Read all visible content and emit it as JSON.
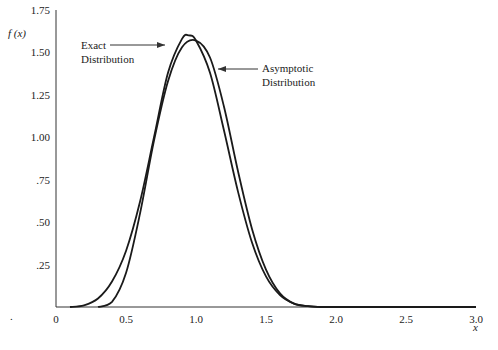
{
  "chart_data": {
    "type": "line",
    "title": "",
    "xlabel": "x",
    "ylabel": "f (x)",
    "xlim": [
      0,
      3.0
    ],
    "ylim": [
      0,
      1.75
    ],
    "x_ticks": [
      "0",
      "0.5",
      "1.0",
      "1.5",
      "2.0",
      "2.5",
      "3.0"
    ],
    "y_ticks": [
      ".25",
      ".50",
      ".75",
      "1.00",
      "1.25",
      "1.50",
      "1.75"
    ],
    "grid": false,
    "series": [
      {
        "name": "Exact Distribution",
        "x": [
          0.1,
          0.2,
          0.3,
          0.4,
          0.5,
          0.6,
          0.7,
          0.8,
          0.9,
          0.95,
          1.0,
          1.1,
          1.2,
          1.3,
          1.4,
          1.5,
          1.6,
          1.7,
          1.8,
          1.9,
          2.0,
          3.0
        ],
        "y": [
          0.0,
          0.01,
          0.05,
          0.15,
          0.33,
          0.62,
          1.0,
          1.38,
          1.58,
          1.6,
          1.57,
          1.38,
          1.04,
          0.68,
          0.38,
          0.18,
          0.07,
          0.02,
          0.005,
          0.0,
          0.0,
          0.0
        ]
      },
      {
        "name": "Asymptotic Distribution",
        "x": [
          0.3,
          0.4,
          0.5,
          0.6,
          0.7,
          0.8,
          0.9,
          1.0,
          1.1,
          1.2,
          1.3,
          1.4,
          1.5,
          1.6,
          1.7,
          1.8,
          1.9,
          2.0,
          3.0
        ],
        "y": [
          0.0,
          0.03,
          0.2,
          0.55,
          0.98,
          1.33,
          1.53,
          1.57,
          1.47,
          1.18,
          0.8,
          0.46,
          0.22,
          0.08,
          0.02,
          0.005,
          0.0,
          0.0,
          0.0
        ]
      }
    ],
    "annotations": [
      {
        "text_lines": [
          "Exact",
          "Distribution"
        ],
        "points_to": "Exact Distribution"
      },
      {
        "text_lines": [
          "Asymptotic",
          "Distribution"
        ],
        "points_to": "Asymptotic Distribution"
      }
    ],
    "legend": "none (inline annotations with arrows)"
  }
}
